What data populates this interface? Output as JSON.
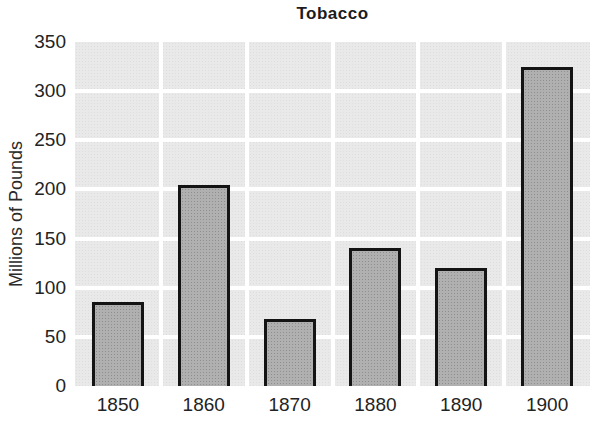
{
  "chart_data": {
    "type": "bar",
    "title": "Tobacco",
    "ylabel": "Millions of Pounds",
    "xlabel": "",
    "categories": [
      "1850",
      "1860",
      "1870",
      "1880",
      "1890",
      "1900"
    ],
    "values": [
      85,
      205,
      68,
      140,
      120,
      325
    ],
    "yticks": [
      0,
      50,
      100,
      150,
      200,
      250,
      300,
      350
    ],
    "ylim": [
      0,
      350
    ],
    "legend_position": "none",
    "grid": "on",
    "grid_style": "white gridlines over light gray plot background, vertical line between each category",
    "colors": {
      "bar_fill": "#b0b0b0",
      "bar_border": "#141414",
      "plot_background": "#e9e9e9",
      "gridline": "#ffffff",
      "text": "#232323",
      "page_background": "#ffffff"
    }
  }
}
